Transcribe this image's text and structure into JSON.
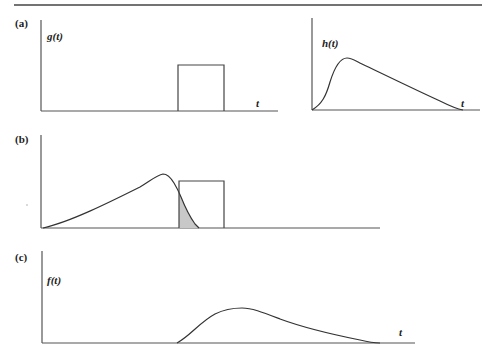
{
  "figure": {
    "panels": [
      {
        "id": "a",
        "label": "(a)",
        "plots": [
          {
            "function_label": "g(t)",
            "x_label": "t",
            "shape": "rectangular pulse"
          },
          {
            "function_label": "h(t)",
            "x_label": "t",
            "shape": "skewed unimodal curve"
          }
        ]
      },
      {
        "id": "b",
        "label": "(b)",
        "plots": [
          {
            "shape": "reversed h curve overlapping rectangular pulse, overlap shaded"
          }
        ]
      },
      {
        "id": "c",
        "label": "(c)",
        "plots": [
          {
            "function_label": "f(t)",
            "x_label": "t",
            "shape": "convolution result curve"
          }
        ]
      }
    ],
    "colors": {
      "line": "#333333",
      "shade": "#c8c8c8",
      "background": "#ffffff"
    }
  }
}
